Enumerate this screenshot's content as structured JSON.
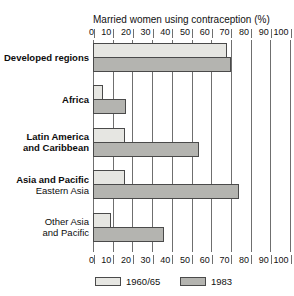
{
  "clipped_caption": {
    "text": " "
  },
  "chart_data": {
    "type": "bar",
    "orientation": "horizontal",
    "title": "Married women using contraception (%)",
    "xlabel": "Married women using contraception (%)",
    "ylabel": "",
    "xlim": [
      0,
      100
    ],
    "xticks": [
      0,
      10,
      20,
      30,
      40,
      50,
      60,
      70,
      80,
      90,
      100
    ],
    "xtick_labels": [
      "0",
      "10",
      "20",
      "30",
      "40",
      "50",
      "60",
      "70",
      "80",
      "90",
      "100"
    ],
    "grid": true,
    "axis_top": true,
    "axis_bottom": true,
    "legend_position": "bottom",
    "categories": [
      "Developed regions",
      "Africa",
      "Latin America and Caribbean",
      "Asia and Pacific Eastern Asia",
      "Other Asia and Pacific"
    ],
    "category_labels": [
      {
        "line1": "Developed regions",
        "line2": "",
        "bold": true,
        "align": "left"
      },
      {
        "line1": "Africa",
        "line2": "",
        "bold": true,
        "align": "left"
      },
      {
        "line1": "Latin America",
        "line2": "and Caribbean",
        "bold": true,
        "align": "left"
      },
      {
        "line1": "Asia and Pacific",
        "line2": "Eastern Asia",
        "bold": true,
        "align": "left"
      },
      {
        "line1": "Other Asia",
        "line2": "and Pacific",
        "bold": false,
        "align": "right"
      }
    ],
    "series": [
      {
        "name": "1960/65",
        "color": "#e6e6e2",
        "values": [
          68,
          5,
          16,
          16,
          9
        ]
      },
      {
        "name": "1983",
        "color": "#b4b4b0",
        "values": [
          70,
          17,
          54,
          74,
          36
        ]
      }
    ]
  },
  "legend": {
    "items": [
      {
        "label": "1960/65",
        "color": "#e6e6e2"
      },
      {
        "label": "1983",
        "color": "#b4b4b0"
      }
    ]
  },
  "colors": {
    "series_1960": "#e6e6e2",
    "series_1983": "#b4b4b0",
    "axis": "#6f6f6f",
    "bar_border": "#4a4a4a",
    "text": "#111111",
    "background": "#ffffff"
  }
}
